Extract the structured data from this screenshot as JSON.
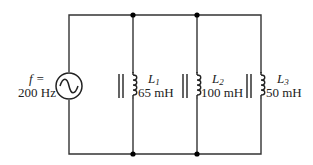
{
  "diagram": {
    "type": "parallel inductor circuit",
    "source": {
      "freq_label": "f =",
      "freq_value": "200 Hz",
      "symbol": "ac-source"
    },
    "inductors": [
      {
        "name": "L",
        "sub": "1",
        "value": "65 mH"
      },
      {
        "name": "L",
        "sub": "2",
        "value": "100 mH"
      },
      {
        "name": "L",
        "sub": "3",
        "value": "50 mH"
      }
    ],
    "colors": {
      "wire": "#333333",
      "node": "#000000",
      "background": "#ffffff"
    }
  }
}
